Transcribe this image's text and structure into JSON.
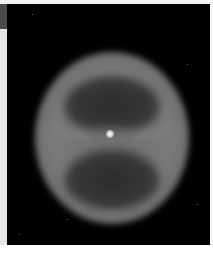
{
  "image": {
    "subject": "planetary nebula",
    "palette": "grayscale",
    "colors": {
      "background": "#000000",
      "shell": "#7a7a7a",
      "lobes": "#333333",
      "central_star": "#ffffff",
      "frame": "#ffffff",
      "side_tab": "#4a4a4a"
    }
  }
}
